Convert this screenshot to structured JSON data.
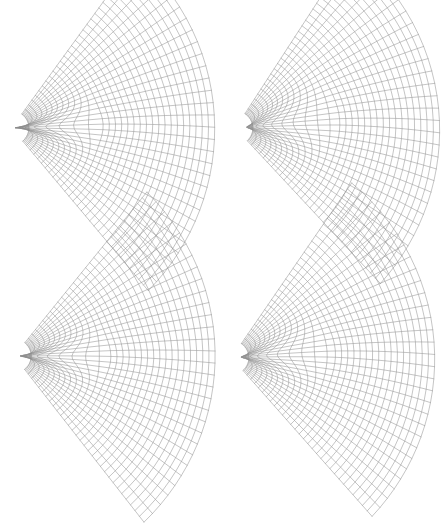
{
  "figure": {
    "width": 448,
    "height": 461,
    "background_color": "#ffffff",
    "panel_count": 4,
    "rows": 2,
    "cols": 2
  },
  "chart_data": {
    "type": "line",
    "subtype": "curvilinear-mesh-grid",
    "title": "",
    "subtitle": "",
    "xlabel": "",
    "ylabel": "",
    "grid": false,
    "legend": null,
    "annotations": [],
    "tick_labels": {
      "x": [],
      "y": []
    },
    "axis_ranges": {
      "x": [
        0,
        1
      ],
      "y": [
        0,
        1
      ]
    },
    "series": [
      {
        "name": "panel-1",
        "position": "top-left",
        "origin": [
          12,
          128
        ],
        "nu": 30,
        "nv": 30,
        "radius_inner": 0.085,
        "radius_outer": 1.0,
        "angle_start": -52,
        "angle_end": 52,
        "scale": 203,
        "cusp_strength": 0.255,
        "cusp_x": 0.4,
        "cusp_spread": 0.165,
        "twist": 0.035,
        "bulge": 0.085,
        "rotation": -2.0,
        "stroke": "#8a8a8a",
        "stroke_width": 0.5
      },
      {
        "name": "panel-2",
        "position": "top-right",
        "origin": [
          236,
          128
        ],
        "nu": 30,
        "nv": 30,
        "radius_inner": 0.085,
        "radius_outer": 1.0,
        "angle_start": -54,
        "angle_end": 50,
        "scale": 204,
        "cusp_strength": 0.215,
        "cusp_x": 0.455,
        "cusp_spread": 0.235,
        "twist": 0.055,
        "bulge": 0.075,
        "rotation": -3.0,
        "stroke": "#8a8a8a",
        "stroke_width": 0.5
      },
      {
        "name": "panel-3",
        "position": "bottom-left",
        "origin": [
          14,
          356
        ],
        "nu": 30,
        "nv": 30,
        "radius_inner": 0.085,
        "radius_outer": 1.0,
        "angle_start": -50,
        "angle_end": 53,
        "scale": 201,
        "cusp_strength": 0.245,
        "cusp_x": 0.425,
        "cusp_spread": 0.175,
        "twist": 0.03,
        "bulge": 0.09,
        "rotation": -1.0,
        "stroke": "#8a8a8a",
        "stroke_width": 0.5
      },
      {
        "name": "panel-4",
        "position": "bottom-right",
        "origin": [
          232,
          358
        ],
        "nu": 30,
        "nv": 30,
        "radius_inner": 0.085,
        "radius_outer": 1.0,
        "angle_start": -53,
        "angle_end": 51,
        "scale": 203,
        "cusp_strength": 0.225,
        "cusp_x": 0.445,
        "cusp_spread": 0.215,
        "twist": 0.05,
        "bulge": 0.08,
        "rotation": -2.5,
        "stroke": "#8a8a8a",
        "stroke_width": 0.5
      }
    ]
  }
}
